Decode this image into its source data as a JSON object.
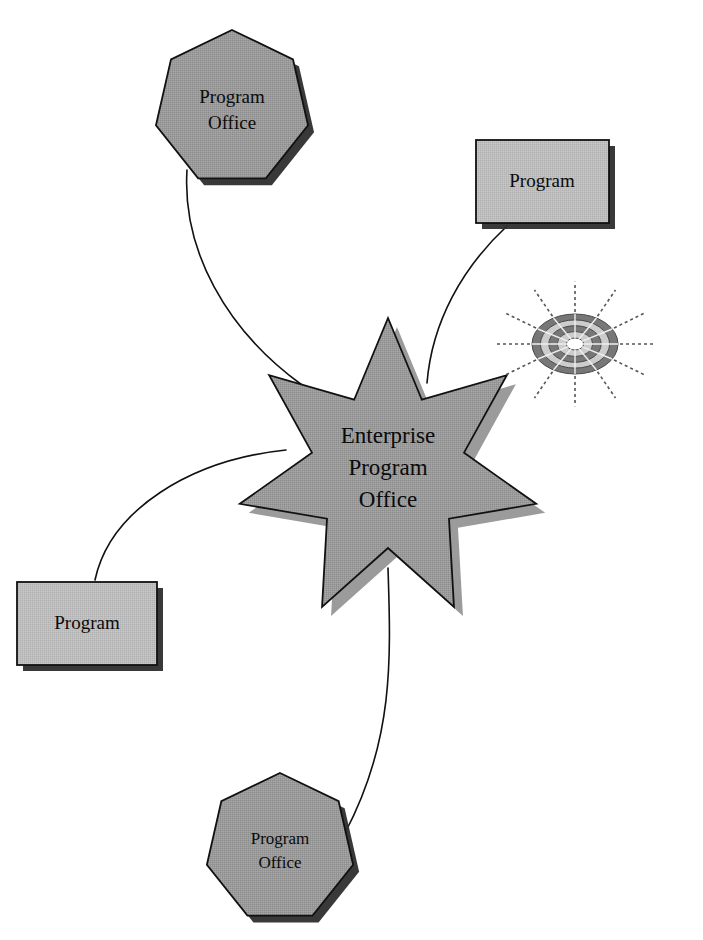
{
  "diagram": {
    "background_color": "#ffffff",
    "palette": {
      "star_fill": "#9a9a9a",
      "node_fill": "#bdbdbd",
      "outline": "#111111",
      "shadow": "#3a3a3a",
      "connector": "#111111",
      "decor_ring_dark": "#777777",
      "decor_ring_light": "#cccccc",
      "decor_ray": "#555555",
      "text": "#0a0a0a"
    },
    "center": {
      "id": "enterprise-program-office",
      "shape": "7-point-star",
      "label_lines": [
        "Enterprise",
        "Program",
        "Office"
      ],
      "label_line_1": "Enterprise",
      "label_line_2": "Program",
      "label_line_3": "Office",
      "cx": 388,
      "cy": 470,
      "outer_radius": 152,
      "inner_radius": 78,
      "rotation_deg": -90
    },
    "nodes": [
      {
        "id": "program-office-top-left",
        "shape": "heptagon",
        "label_lines": [
          "Program",
          "Office"
        ],
        "label_line_1": "Program",
        "label_line_2": "Office",
        "cx": 232,
        "cy": 108,
        "radius": 78,
        "rotation_deg": -90
      },
      {
        "id": "program-top-right",
        "shape": "rectangle",
        "label_lines": [
          "Program"
        ],
        "label_line_1": "Program",
        "x": 476,
        "y": 140,
        "width": 133,
        "height": 83
      },
      {
        "id": "program-bottom-left",
        "shape": "rectangle",
        "label_lines": [
          "Program"
        ],
        "label_line_1": "Program",
        "x": 17,
        "y": 582,
        "width": 140,
        "height": 83
      },
      {
        "id": "program-office-bottom",
        "shape": "heptagon",
        "label_lines": [
          "Program",
          "Office"
        ],
        "label_line_1": "Program",
        "label_line_2": "Office",
        "cx": 280,
        "cy": 848,
        "radius": 75,
        "rotation_deg": -90
      }
    ],
    "connectors": [
      {
        "id": "connector-top-left",
        "from": "program-office-top-left",
        "to": "enterprise-program-office",
        "path": "M 187 170 C 182 250 226 330 302 385"
      },
      {
        "id": "connector-top-right",
        "from": "program-top-right",
        "to": "enterprise-program-office",
        "path": "M 507 226 C 462 268 432 322 427 383"
      },
      {
        "id": "connector-bottom-left",
        "from": "program-bottom-left",
        "to": "enterprise-program-office",
        "path": "M 95 580 C 110 510 190 460 286 450"
      },
      {
        "id": "connector-bottom",
        "from": "program-office-bottom",
        "to": "enterprise-program-office",
        "path": "M 388 568 C 391 660 394 740 345 833"
      }
    ],
    "decoration": {
      "id": "radial-burst",
      "name": "sun-burst-icon",
      "cx": 575,
      "cy": 344,
      "rx": 43,
      "ry": 30,
      "ray_count": 12,
      "ray_length": 38,
      "ring_count": 4
    }
  }
}
